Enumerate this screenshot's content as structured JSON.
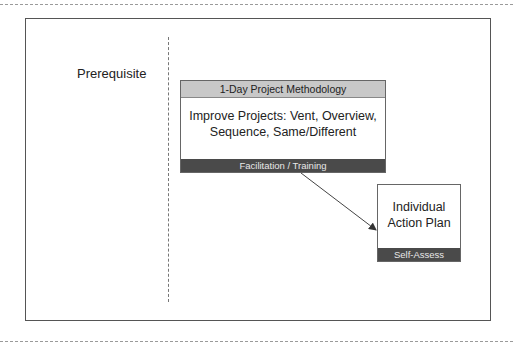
{
  "diagram": {
    "left_column_label": "Prerequisite",
    "main_box": {
      "header": "1-Day Project Methodology",
      "body_line1": "Improve Projects: Vent, Overview,",
      "body_line2": "Sequence, Same/Different",
      "footer": "Facilitation / Training"
    },
    "side_box": {
      "body_line1": "Individual",
      "body_line2": "Action Plan",
      "footer": "Self-Assess"
    },
    "connector": {
      "from": "main_box",
      "to": "side_box",
      "type": "arrow"
    }
  },
  "colors": {
    "header_fill": "#c8c8c8",
    "footer_fill": "#4a4a4a",
    "border": "#666666"
  }
}
